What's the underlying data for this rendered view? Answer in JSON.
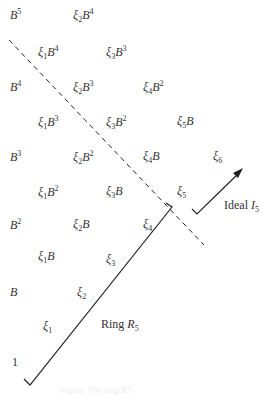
{
  "diagram": {
    "terms": [
      {
        "id": "B5",
        "sym": "",
        "sub": "",
        "base": "B",
        "pow": "5",
        "x": 10,
        "y": 8
      },
      {
        "id": "xi2B4",
        "sym": "ξ",
        "sub": "2",
        "base": "B",
        "pow": "4",
        "x": 73,
        "y": 8
      },
      {
        "id": "xi1B4",
        "sym": "ξ",
        "sub": "1",
        "base": "B",
        "pow": "4",
        "x": 38,
        "y": 45
      },
      {
        "id": "xi3B3",
        "sym": "ξ",
        "sub": "3",
        "base": "B",
        "pow": "3",
        "x": 106,
        "y": 45
      },
      {
        "id": "B4",
        "sym": "",
        "sub": "",
        "base": "B",
        "pow": "4",
        "x": 10,
        "y": 80
      },
      {
        "id": "xi2B3",
        "sym": "ξ",
        "sub": "2",
        "base": "B",
        "pow": "3",
        "x": 73,
        "y": 80
      },
      {
        "id": "xi4B2",
        "sym": "ξ",
        "sub": "4",
        "base": "B",
        "pow": "2",
        "x": 143,
        "y": 80
      },
      {
        "id": "xi1B3",
        "sym": "ξ",
        "sub": "1",
        "base": "B",
        "pow": "3",
        "x": 38,
        "y": 115
      },
      {
        "id": "xi3B2",
        "sym": "ξ",
        "sub": "3",
        "base": "B",
        "pow": "2",
        "x": 106,
        "y": 115
      },
      {
        "id": "xi5B",
        "sym": "ξ",
        "sub": "5",
        "base": "B",
        "pow": "",
        "x": 177,
        "y": 115
      },
      {
        "id": "B3",
        "sym": "",
        "sub": "",
        "base": "B",
        "pow": "3",
        "x": 10,
        "y": 150
      },
      {
        "id": "xi2B2",
        "sym": "ξ",
        "sub": "2",
        "base": "B",
        "pow": "2",
        "x": 73,
        "y": 150
      },
      {
        "id": "xi4B",
        "sym": "ξ",
        "sub": "4",
        "base": "B",
        "pow": "",
        "x": 143,
        "y": 150
      },
      {
        "id": "xi6",
        "sym": "ξ",
        "sub": "6",
        "base": "",
        "pow": "",
        "x": 213,
        "y": 150
      },
      {
        "id": "xi1B2",
        "sym": "ξ",
        "sub": "1",
        "base": "B",
        "pow": "2",
        "x": 38,
        "y": 185
      },
      {
        "id": "xi3B",
        "sym": "ξ",
        "sub": "3",
        "base": "B",
        "pow": "",
        "x": 106,
        "y": 185
      },
      {
        "id": "xi5",
        "sym": "ξ",
        "sub": "5",
        "base": "",
        "pow": "",
        "x": 177,
        "y": 185
      },
      {
        "id": "B2",
        "sym": "",
        "sub": "",
        "base": "B",
        "pow": "2",
        "x": 10,
        "y": 218
      },
      {
        "id": "xi2B",
        "sym": "ξ",
        "sub": "2",
        "base": "B",
        "pow": "",
        "x": 73,
        "y": 218
      },
      {
        "id": "xi4",
        "sym": "ξ",
        "sub": "4",
        "base": "",
        "pow": "",
        "x": 143,
        "y": 218
      },
      {
        "id": "xi1B",
        "sym": "ξ",
        "sub": "1",
        "base": "B",
        "pow": "",
        "x": 38,
        "y": 250
      },
      {
        "id": "xi3",
        "sym": "ξ",
        "sub": "3",
        "base": "",
        "pow": "",
        "x": 106,
        "y": 253
      },
      {
        "id": "B",
        "sym": "",
        "sub": "",
        "base": "B",
        "pow": "",
        "x": 10,
        "y": 286
      },
      {
        "id": "xi2",
        "sym": "ξ",
        "sub": "2",
        "base": "",
        "pow": "",
        "x": 77,
        "y": 286
      },
      {
        "id": "xi1",
        "sym": "ξ",
        "sub": "1",
        "base": "",
        "pow": "",
        "x": 43,
        "y": 320
      },
      {
        "id": "one",
        "sym": "",
        "sub": "",
        "base": "1",
        "pow": "",
        "x": 12,
        "y": 356
      }
    ],
    "ring_label": {
      "text": "Ring ",
      "var": "R",
      "sub": "5"
    },
    "ideal_label": {
      "text": "Ideal ",
      "var": "I",
      "sub": "5"
    },
    "caption": "Figure: The ring R5"
  }
}
